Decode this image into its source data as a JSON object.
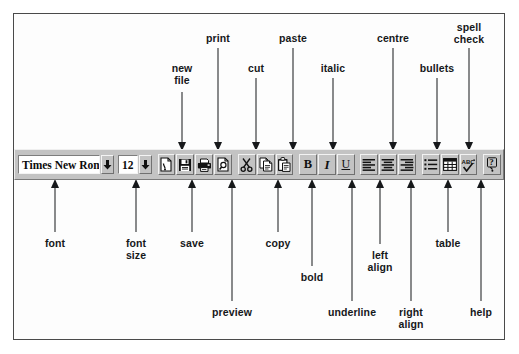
{
  "diagram": {
    "ink_color": "#16181a",
    "toolbar_face_color": "#c3c3c3"
  },
  "toolbar": {
    "font_name": {
      "value": "Times New Roman",
      "dropdown_icon": "chevron-down-icon"
    },
    "font_size": {
      "value": "12",
      "dropdown_icon": "chevron-down-icon"
    },
    "buttons": [
      {
        "name": "new-file",
        "icon": "new-file-icon",
        "label": "new file"
      },
      {
        "name": "save",
        "icon": "floppy-disk-icon",
        "label": "save"
      },
      {
        "name": "print",
        "icon": "printer-icon",
        "label": "print"
      },
      {
        "name": "preview",
        "icon": "print-preview-icon",
        "label": "preview"
      },
      {
        "name": "cut",
        "icon": "scissors-icon",
        "label": "cut"
      },
      {
        "name": "copy",
        "icon": "copy-pages-icon",
        "label": "copy"
      },
      {
        "name": "paste",
        "icon": "clipboard-icon",
        "label": "paste"
      },
      {
        "name": "bold",
        "icon": "bold-icon",
        "label": "bold",
        "glyph": "B"
      },
      {
        "name": "italic",
        "icon": "italic-icon",
        "label": "italic",
        "glyph": "I"
      },
      {
        "name": "underline",
        "icon": "underline-icon",
        "label": "underline",
        "glyph": "U"
      },
      {
        "name": "left-align",
        "icon": "align-left-icon",
        "label": "left align"
      },
      {
        "name": "centre",
        "icon": "align-centre-icon",
        "label": "centre"
      },
      {
        "name": "right-align",
        "icon": "align-right-icon",
        "label": "right align"
      },
      {
        "name": "bullets",
        "icon": "bulleted-list-icon",
        "label": "bullets"
      },
      {
        "name": "table",
        "icon": "table-grid-icon",
        "label": "table"
      },
      {
        "name": "spell-check",
        "icon": "spell-check-abc-tick-icon",
        "label": "spell check"
      },
      {
        "name": "help",
        "icon": "question-mark-help-icon",
        "label": "help"
      }
    ]
  },
  "callouts": {
    "above": [
      {
        "id": "new-file",
        "text": "new\nfile",
        "label_x": 182,
        "label_y": 63,
        "line_x": 182,
        "line_top": 92,
        "line_bottom": 142
      },
      {
        "id": "print",
        "text": "print",
        "label_x": 218,
        "label_y": 33,
        "line_x": 218,
        "line_top": 48,
        "line_bottom": 142
      },
      {
        "id": "cut",
        "text": "cut",
        "label_x": 256,
        "label_y": 63,
        "line_x": 256,
        "line_top": 78,
        "line_bottom": 142
      },
      {
        "id": "paste",
        "text": "paste",
        "label_x": 293,
        "label_y": 33,
        "line_x": 293,
        "line_top": 48,
        "line_bottom": 142
      },
      {
        "id": "italic",
        "text": "italic",
        "label_x": 333,
        "label_y": 63,
        "line_x": 333,
        "line_top": 78,
        "line_bottom": 142
      },
      {
        "id": "centre",
        "text": "centre",
        "label_x": 393,
        "label_y": 33,
        "line_x": 393,
        "line_top": 48,
        "line_bottom": 142
      },
      {
        "id": "bullets",
        "text": "bullets",
        "label_x": 437,
        "label_y": 63,
        "line_x": 437,
        "line_top": 78,
        "line_bottom": 142
      },
      {
        "id": "spell-check",
        "text": "spell\ncheck",
        "label_x": 469,
        "label_y": 22,
        "line_x": 469,
        "line_top": 48,
        "line_bottom": 142
      }
    ],
    "below": [
      {
        "id": "font",
        "text": "font",
        "label_x": 55,
        "label_y": 238,
        "line_x": 55,
        "line_top": 188,
        "line_bottom": 232
      },
      {
        "id": "font-size",
        "text": "font\nsize",
        "label_x": 136,
        "label_y": 238,
        "line_x": 136,
        "line_top": 188,
        "line_bottom": 232
      },
      {
        "id": "save",
        "text": "save",
        "label_x": 192,
        "label_y": 238,
        "line_x": 192,
        "line_top": 188,
        "line_bottom": 232
      },
      {
        "id": "preview",
        "text": "preview",
        "label_x": 232,
        "label_y": 307,
        "line_x": 232,
        "line_top": 188,
        "line_bottom": 301
      },
      {
        "id": "copy",
        "text": "copy",
        "label_x": 278,
        "label_y": 238,
        "line_x": 278,
        "line_top": 188,
        "line_bottom": 232
      },
      {
        "id": "bold",
        "text": "bold",
        "label_x": 312,
        "label_y": 272,
        "line_x": 312,
        "line_top": 188,
        "line_bottom": 266
      },
      {
        "id": "underline",
        "text": "underline",
        "label_x": 352,
        "label_y": 307,
        "line_x": 352,
        "line_top": 188,
        "line_bottom": 301
      },
      {
        "id": "left-align",
        "text": "left\nalign",
        "label_x": 380,
        "label_y": 250,
        "line_x": 380,
        "line_top": 188,
        "line_bottom": 244
      },
      {
        "id": "right-align",
        "text": "right\nalign",
        "label_x": 411,
        "label_y": 307,
        "line_x": 411,
        "line_top": 188,
        "line_bottom": 301
      },
      {
        "id": "table",
        "text": "table",
        "label_x": 448,
        "label_y": 238,
        "line_x": 448,
        "line_top": 188,
        "line_bottom": 232
      },
      {
        "id": "help",
        "text": "help",
        "label_x": 481,
        "label_y": 307,
        "line_x": 481,
        "line_top": 188,
        "line_bottom": 301
      }
    ]
  }
}
